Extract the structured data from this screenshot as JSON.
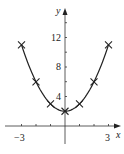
{
  "chart_data": {
    "type": "line",
    "title": "",
    "function": "y = x^2 + 2",
    "xlabel": "x",
    "ylabel": "y",
    "x": [
      -3,
      -2,
      -1,
      0,
      1,
      2,
      3
    ],
    "values": [
      11,
      6,
      3,
      2,
      3,
      6,
      11
    ],
    "markers": "x",
    "x_ticks": [
      -3,
      -2,
      -1,
      1,
      2,
      3
    ],
    "x_tick_labels": [
      "−3",
      "3"
    ],
    "y_ticks": [
      4,
      8,
      12
    ],
    "y_tick_labels": [
      "4",
      "8",
      "12"
    ],
    "xlim": [
      -3.5,
      3.6
    ],
    "ylim": [
      -2,
      16
    ],
    "grid": false,
    "legend": null
  },
  "axes": {
    "x_label": "x",
    "y_label": "y",
    "x_tick_neg": "−3",
    "x_tick_pos": "3",
    "y_tick_4": "4",
    "y_tick_8": "8",
    "y_tick_12": "12"
  }
}
